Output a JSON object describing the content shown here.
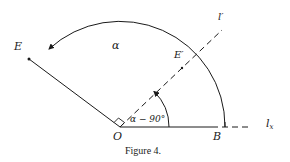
{
  "figure": {
    "caption": "Figure 4.",
    "labels": {
      "E": "E",
      "E_prime": "E′",
      "l_prime": "l′",
      "O": "O",
      "B": "B",
      "l_x": "l",
      "l_x_sub": "x",
      "alpha": "α",
      "alpha_minus_90": "α − 90°"
    },
    "points": {
      "O": [
        120,
        127
      ],
      "B": [
        218,
        127
      ],
      "E": [
        29,
        59
      ],
      "E_prime": [
        182,
        66
      ],
      "l_prime_end": [
        222,
        30
      ],
      "l_x_end": [
        248,
        127
      ]
    },
    "colors": {
      "ink": "#1a1a1a",
      "background": "#ffffff"
    }
  }
}
